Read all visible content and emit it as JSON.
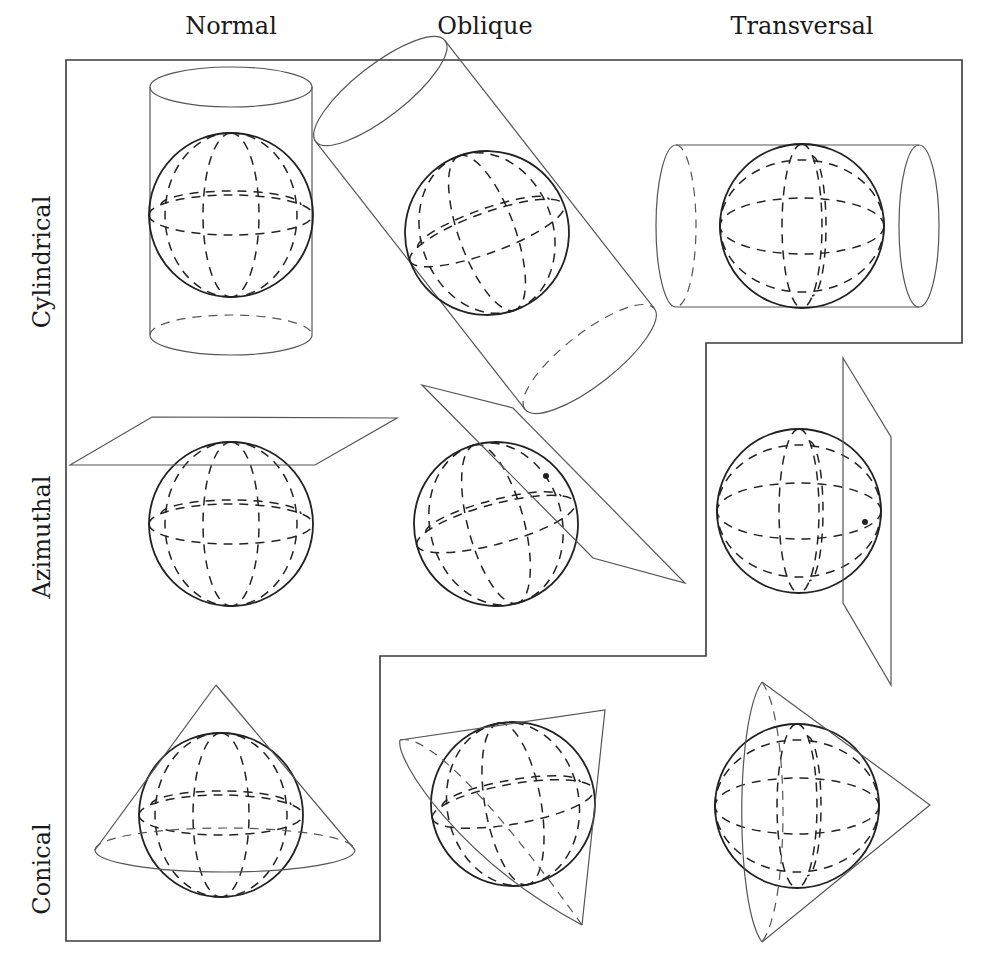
{
  "figure": {
    "columns": [
      {
        "label": "Normal",
        "x": 231
      },
      {
        "label": "Oblique",
        "x": 485
      },
      {
        "label": "Transversal",
        "x": 802
      }
    ],
    "rows": [
      {
        "label": "Cylindrical",
        "y": 262
      },
      {
        "label": "Azimuthal",
        "y": 537
      },
      {
        "label": "Conical",
        "y": 869
      }
    ],
    "cells": [
      {
        "row": "Cylindrical",
        "column": "Normal",
        "surface": "cylinder",
        "axis": "vertical"
      },
      {
        "row": "Cylindrical",
        "column": "Oblique",
        "surface": "cylinder",
        "axis": "tilted"
      },
      {
        "row": "Cylindrical",
        "column": "Transversal",
        "surface": "cylinder",
        "axis": "horizontal"
      },
      {
        "row": "Azimuthal",
        "column": "Normal",
        "surface": "plane",
        "tangent": "pole"
      },
      {
        "row": "Azimuthal",
        "column": "Oblique",
        "surface": "plane",
        "tangent": "mid-latitude"
      },
      {
        "row": "Azimuthal",
        "column": "Transversal",
        "surface": "plane",
        "tangent": "equator"
      },
      {
        "row": "Conical",
        "column": "Normal",
        "surface": "cone",
        "apex": "up"
      },
      {
        "row": "Conical",
        "column": "Oblique",
        "surface": "cone",
        "apex": "tilted"
      },
      {
        "row": "Conical",
        "column": "Transversal",
        "surface": "cone",
        "apex": "right"
      }
    ],
    "colors": {
      "line": "#222222",
      "surface": "#555555",
      "background": "#ffffff"
    }
  }
}
